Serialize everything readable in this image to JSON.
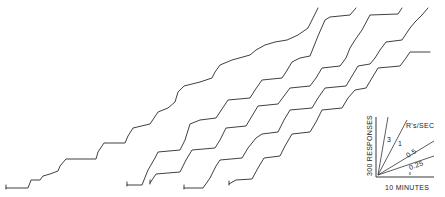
{
  "chart_data": {
    "type": "line",
    "title": "",
    "xlabel": "10 MINUTES",
    "ylabel": "300 RESPONSES",
    "grid": false,
    "legend": {
      "position": "lower-right",
      "title": "R's/SEC",
      "rate_lines": [
        "3",
        "1",
        "0.5",
        "0.25"
      ]
    },
    "series": [
      {
        "name": "record-1",
        "points": [
          [
            6,
            188
          ],
          [
            28,
            188
          ],
          [
            31,
            180
          ],
          [
            40,
            180
          ],
          [
            43,
            176
          ],
          [
            50,
            174
          ],
          [
            58,
            171
          ],
          [
            60,
            166
          ],
          [
            66,
            159
          ],
          [
            96,
            159
          ],
          [
            98,
            152
          ],
          [
            104,
            143
          ],
          [
            125,
            143
          ],
          [
            128,
            136
          ],
          [
            133,
            128
          ],
          [
            150,
            124
          ],
          [
            158,
            112
          ],
          [
            168,
            108
          ],
          [
            175,
            102
          ],
          [
            178,
            92
          ],
          [
            184,
            86
          ],
          [
            200,
            82
          ],
          [
            212,
            78
          ],
          [
            215,
            72
          ],
          [
            220,
            65
          ],
          [
            232,
            60
          ],
          [
            250,
            55
          ],
          [
            256,
            50
          ],
          [
            265,
            45
          ],
          [
            275,
            42
          ],
          [
            287,
            40
          ],
          [
            298,
            35
          ],
          [
            308,
            28
          ],
          [
            313,
            18
          ],
          [
            318,
            8
          ]
        ]
      },
      {
        "name": "record-2",
        "points": [
          [
            127,
            185
          ],
          [
            142,
            185
          ],
          [
            148,
            170
          ],
          [
            155,
            158
          ],
          [
            158,
            152
          ],
          [
            180,
            150
          ],
          [
            185,
            140
          ],
          [
            190,
            124
          ],
          [
            200,
            120
          ],
          [
            216,
            118
          ],
          [
            220,
            112
          ],
          [
            228,
            100
          ],
          [
            250,
            98
          ],
          [
            255,
            90
          ],
          [
            262,
            80
          ],
          [
            282,
            78
          ],
          [
            286,
            72
          ],
          [
            292,
            62
          ],
          [
            300,
            58
          ],
          [
            310,
            56
          ],
          [
            314,
            46
          ],
          [
            318,
            36
          ],
          [
            325,
            20
          ],
          [
            330,
            17
          ],
          [
            350,
            15
          ],
          [
            356,
            8
          ]
        ]
      },
      {
        "name": "record-3",
        "points": [
          [
            150,
            183
          ],
          [
            156,
            174
          ],
          [
            180,
            172
          ],
          [
            186,
            160
          ],
          [
            192,
            150
          ],
          [
            215,
            148
          ],
          [
            220,
            140
          ],
          [
            226,
            128
          ],
          [
            246,
            126
          ],
          [
            252,
            116
          ],
          [
            258,
            106
          ],
          [
            278,
            104
          ],
          [
            284,
            96
          ],
          [
            290,
            88
          ],
          [
            310,
            86
          ],
          [
            316,
            78
          ],
          [
            322,
            68
          ],
          [
            340,
            66
          ],
          [
            346,
            58
          ],
          [
            350,
            48
          ],
          [
            355,
            40
          ],
          [
            362,
            30
          ],
          [
            370,
            15
          ],
          [
            398,
            14
          ],
          [
            402,
            8
          ]
        ]
      },
      {
        "name": "record-4",
        "points": [
          [
            184,
            188
          ],
          [
            203,
            188
          ],
          [
            210,
            178
          ],
          [
            216,
            166
          ],
          [
            220,
            160
          ],
          [
            242,
            158
          ],
          [
            248,
            148
          ],
          [
            256,
            138
          ],
          [
            262,
            134
          ],
          [
            278,
            132
          ],
          [
            284,
            120
          ],
          [
            290,
            110
          ],
          [
            312,
            108
          ],
          [
            318,
            98
          ],
          [
            325,
            88
          ],
          [
            346,
            86
          ],
          [
            352,
            76
          ],
          [
            358,
            66
          ],
          [
            370,
            64
          ],
          [
            375,
            58
          ],
          [
            380,
            50
          ],
          [
            386,
            42
          ],
          [
            402,
            40
          ],
          [
            410,
            28
          ],
          [
            415,
            22
          ],
          [
            422,
            15
          ],
          [
            428,
            8
          ]
        ]
      },
      {
        "name": "record-5",
        "points": [
          [
            229,
            184
          ],
          [
            236,
            180
          ],
          [
            252,
            179
          ],
          [
            258,
            168
          ],
          [
            264,
            158
          ],
          [
            280,
            156
          ],
          [
            285,
            146
          ],
          [
            292,
            134
          ],
          [
            310,
            132
          ],
          [
            316,
            122
          ],
          [
            322,
            110
          ],
          [
            342,
            108
          ],
          [
            348,
            98
          ],
          [
            355,
            90
          ],
          [
            366,
            88
          ],
          [
            372,
            78
          ],
          [
            378,
            68
          ],
          [
            400,
            66
          ],
          [
            406,
            58
          ],
          [
            410,
            52
          ],
          [
            430,
            52
          ]
        ]
      }
    ],
    "axis_ranges": {
      "x": [
        0,
        445
      ],
      "y": [
        197,
        0
      ]
    }
  },
  "key": {
    "x_label": "10 MINUTES",
    "y_label": "300 RESPONSES",
    "rate_title": "R's/SEC",
    "rate_3": "3",
    "rate_1": "1",
    "rate_05": "0.5",
    "rate_025": "0.25"
  }
}
